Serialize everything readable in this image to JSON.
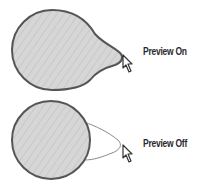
{
  "panels": [
    {
      "id": "preview-on",
      "label": "Preview On",
      "shape": "teardrop-filled",
      "fill_color": "#d4d4d4",
      "stroke_color": "#555555"
    },
    {
      "id": "preview-off",
      "label": "Preview Off",
      "shape": "circle-with-outline-preview",
      "fill_color": "#d4d4d4",
      "stroke_color": "#555555",
      "preview_outline_color": "#8a8a8a"
    }
  ],
  "icons": {
    "cursor": "arrow-pointer-icon"
  }
}
